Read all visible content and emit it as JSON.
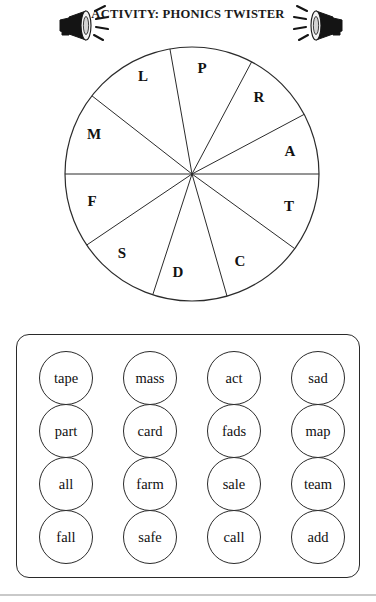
{
  "header": {
    "title": "ACTIVITY: PHONICS TWISTER",
    "icon_left": "megaphone-icon",
    "icon_right": "megaphone-icon"
  },
  "wheel": {
    "segment_count": 10,
    "stroke_color": "#2b2b2b",
    "fill_color": "#ffffff",
    "letters": [
      "P",
      "R",
      "A",
      "T",
      "C",
      "D",
      "S",
      "F",
      "M",
      "L"
    ],
    "segments": [
      {
        "label": "P",
        "start_angle": -100,
        "end_angle": -62,
        "label_x": 202,
        "label_y": 70
      },
      {
        "label": "R",
        "start_angle": -62,
        "end_angle": -28,
        "label_x": 259,
        "label_y": 99
      },
      {
        "label": "A",
        "start_angle": -28,
        "end_angle": 0,
        "label_x": 290,
        "label_y": 153
      },
      {
        "label": "T",
        "start_angle": 0,
        "end_angle": 36,
        "label_x": 289,
        "label_y": 208
      },
      {
        "label": "C",
        "start_angle": 36,
        "end_angle": 74,
        "label_x": 240,
        "label_y": 263
      },
      {
        "label": "D",
        "start_angle": 74,
        "end_angle": 108,
        "label_x": 178,
        "label_y": 274
      },
      {
        "label": "S",
        "start_angle": 108,
        "end_angle": 146,
        "label_x": 122,
        "label_y": 255
      },
      {
        "label": "F",
        "start_angle": 146,
        "end_angle": 180,
        "label_x": 92,
        "label_y": 203
      },
      {
        "label": "M",
        "start_angle": 180,
        "end_angle": 218,
        "label_x": 94,
        "label_y": 136
      },
      {
        "label": "L",
        "start_angle": 218,
        "end_angle": 260,
        "label_x": 143,
        "label_y": 78
      }
    ]
  },
  "word_box": {
    "columns": [
      {
        "words": [
          "tape",
          "part",
          "all",
          "fall"
        ]
      },
      {
        "words": [
          "mass",
          "card",
          "farm",
          "safe"
        ]
      },
      {
        "words": [
          "act",
          "fads",
          "sale",
          "call"
        ]
      },
      {
        "words": [
          "sad",
          "map",
          "team",
          "add"
        ]
      }
    ]
  }
}
